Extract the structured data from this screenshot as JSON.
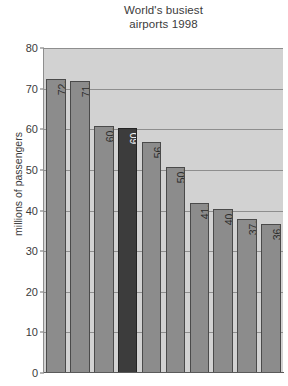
{
  "chart_data": {
    "type": "bar",
    "title": "World's busiest airports 1998",
    "title_lines": [
      "World's busiest",
      "airports 1998"
    ],
    "xlabel": "",
    "ylabel": "millions of passengers",
    "ylim": [
      0,
      80
    ],
    "yticks": [
      0,
      10,
      20,
      30,
      40,
      50,
      60,
      70,
      80
    ],
    "ytick_labels": [
      "0",
      "10",
      "20",
      "30",
      "40",
      "50",
      "60",
      "70",
      "80"
    ],
    "grid": true,
    "legend": "none",
    "categories": [
      "Atlanta",
      "Chicago",
      "Los Angeles",
      "Heathrow",
      "Dallas",
      "Tokyo",
      "Frankfurt",
      "San Francisco",
      "Paris",
      "Denver"
    ],
    "values": [
      72.3,
      71.9,
      60.9,
      60.2,
      56.9,
      50.8,
      41.9,
      40.3,
      37.9,
      36.6
    ],
    "value_labels": [
      "72.3",
      "71.9",
      "60.9",
      "60.2",
      "56.9",
      "50.8",
      "41.9",
      "40.3",
      "37.9",
      "36.6"
    ],
    "highlighted_category": "Heathrow",
    "colors": {
      "bar": "#8c8c8c",
      "bar_highlight": "#3c3c3c",
      "bar_border": "#4a4a4a",
      "plot_background": "#d2d2d2",
      "gridline": "#8e8e8e",
      "text": "#3b3b3b",
      "page_background": "#ffffff"
    }
  }
}
